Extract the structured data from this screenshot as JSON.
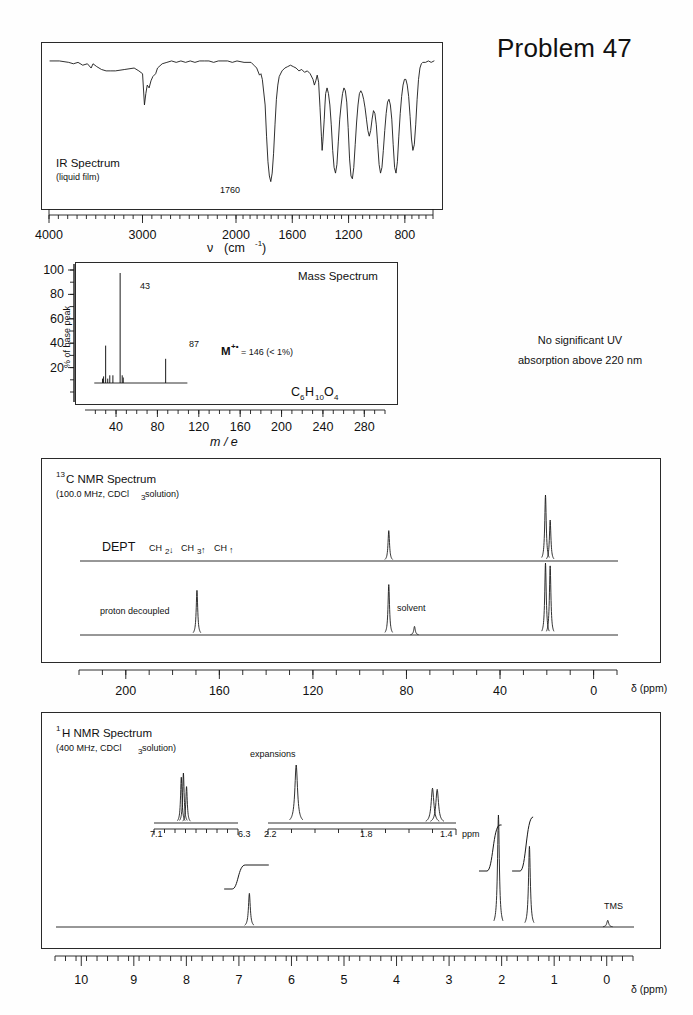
{
  "header": {
    "title": "Problem 47"
  },
  "uv": {
    "line1": "No significant UV",
    "line2": "absorption above 220 nm"
  },
  "ir": {
    "title": "IR Spectrum",
    "subtitle": "(liquid film)",
    "peak_label": "1760",
    "axis_label_symbol": "ν",
    "axis_label_unit": "(cm",
    "axis_label_exp": "-1",
    "axis_label_close": ")",
    "ticks": [
      "4000",
      "3000",
      "2000",
      "1600",
      "1200",
      "800"
    ],
    "tick_values": [
      4000,
      3000,
      2000,
      1600,
      1200,
      800
    ]
  },
  "ms": {
    "title": "Mass Spectrum",
    "ylabel": "% of base peak",
    "xlabel": "m / e",
    "formula_parts": [
      "C",
      "6",
      "H",
      "10",
      "O",
      "4"
    ],
    "molecular_ion": "M",
    "molecular_ion_sup": "+•",
    "molecular_ion_rest": " = 146  (< 1%)",
    "yticks": [
      "100",
      "80",
      "60",
      "40",
      "20"
    ],
    "ytick_values": [
      100,
      80,
      60,
      40,
      20
    ],
    "xticks": [
      "40",
      "80",
      "120",
      "160",
      "200",
      "240",
      "280"
    ],
    "xtick_values": [
      40,
      80,
      120,
      160,
      200,
      240,
      280
    ],
    "peak_labels": [
      "43",
      "87"
    ]
  },
  "c13": {
    "title_sup": "13",
    "title": "C NMR Spectrum",
    "subtitle_a": "(100.0 MHz, CDCl",
    "subtitle_sub": "3",
    "subtitle_b": " solution)",
    "dept_label": "DEPT",
    "dept_keys": [
      "CH",
      "CH",
      "CH"
    ],
    "dept_subs": [
      "2",
      "3",
      ""
    ],
    "dept_arrows": [
      "↓",
      "↑",
      "↑"
    ],
    "decoupled_label": "proton decoupled",
    "solvent_label": "solvent",
    "axis_label": "δ (ppm)",
    "ticks": [
      "200",
      "160",
      "120",
      "80",
      "40",
      "0"
    ],
    "tick_values": [
      200,
      160,
      120,
      80,
      40,
      0
    ]
  },
  "h1": {
    "title_sup": "1",
    "title": "H NMR Spectrum",
    "subtitle_a": "(400 MHz, CDCl",
    "subtitle_sub": "3",
    "subtitle_b": " solution)",
    "expansions_label": "expansions",
    "tms_label": "TMS",
    "axis_label": "δ (ppm)",
    "ticks": [
      "10",
      "9",
      "8",
      "7",
      "6",
      "5",
      "4",
      "3",
      "2",
      "1",
      "0"
    ],
    "tick_values": [
      10,
      9,
      8,
      7,
      6,
      5,
      4,
      3,
      2,
      1,
      0
    ],
    "expansion_left": {
      "start": "7.1",
      "end": "6.3"
    },
    "expansion_right": {
      "start": "2.2",
      "mid": "1.8",
      "end": "1.4",
      "unit": "ppm"
    }
  },
  "chart_data": [
    {
      "type": "line",
      "name": "ir-spectrum",
      "title": "IR Spectrum",
      "xlabel": "wavenumber (cm-1)",
      "ylabel": "transmittance",
      "xlim": [
        4000,
        600
      ],
      "ylim": [
        0,
        100
      ],
      "annotations": [
        {
          "x": 1760,
          "text": "1760"
        }
      ],
      "points": [
        [
          4000,
          93
        ],
        [
          3900,
          93
        ],
        [
          3800,
          92
        ],
        [
          3750,
          91
        ],
        [
          3700,
          92
        ],
        [
          3650,
          90
        ],
        [
          3600,
          91
        ],
        [
          3560,
          88
        ],
        [
          3540,
          91
        ],
        [
          3500,
          89
        ],
        [
          3450,
          87
        ],
        [
          3400,
          86
        ],
        [
          3350,
          86
        ],
        [
          3300,
          86
        ],
        [
          3200,
          87
        ],
        [
          3100,
          88
        ],
        [
          3050,
          86
        ],
        [
          3010,
          84
        ],
        [
          2990,
          62
        ],
        [
          2975,
          70
        ],
        [
          2960,
          76
        ],
        [
          2940,
          74
        ],
        [
          2920,
          79
        ],
        [
          2900,
          82
        ],
        [
          2870,
          84
        ],
        [
          2850,
          88
        ],
        [
          2800,
          91
        ],
        [
          2750,
          92
        ],
        [
          2700,
          93
        ],
        [
          2650,
          92
        ],
        [
          2600,
          93
        ],
        [
          2550,
          92
        ],
        [
          2500,
          93
        ],
        [
          2450,
          92
        ],
        [
          2400,
          93
        ],
        [
          2350,
          93
        ],
        [
          2300,
          93
        ],
        [
          2250,
          92
        ],
        [
          2200,
          93
        ],
        [
          2150,
          93
        ],
        [
          2100,
          93
        ],
        [
          2050,
          92
        ],
        [
          2000,
          93
        ],
        [
          1950,
          92
        ],
        [
          1900,
          92
        ],
        [
          1880,
          90
        ],
        [
          1860,
          88
        ],
        [
          1840,
          83
        ],
        [
          1830,
          84
        ],
        [
          1820,
          80
        ],
        [
          1800,
          62
        ],
        [
          1790,
          40
        ],
        [
          1780,
          22
        ],
        [
          1770,
          12
        ],
        [
          1760,
          8
        ],
        [
          1750,
          14
        ],
        [
          1740,
          28
        ],
        [
          1730,
          48
        ],
        [
          1720,
          66
        ],
        [
          1710,
          76
        ],
        [
          1700,
          82
        ],
        [
          1680,
          86
        ],
        [
          1660,
          88
        ],
        [
          1640,
          89
        ],
        [
          1620,
          90
        ],
        [
          1600,
          89
        ],
        [
          1580,
          88
        ],
        [
          1560,
          86
        ],
        [
          1540,
          87
        ],
        [
          1520,
          85
        ],
        [
          1500,
          86
        ],
        [
          1480,
          84
        ],
        [
          1460,
          80
        ],
        [
          1450,
          76
        ],
        [
          1440,
          79
        ],
        [
          1430,
          83
        ],
        [
          1420,
          78
        ],
        [
          1410,
          60
        ],
        [
          1400,
          40
        ],
        [
          1395,
          30
        ],
        [
          1390,
          36
        ],
        [
          1380,
          52
        ],
        [
          1375,
          62
        ],
        [
          1370,
          70
        ],
        [
          1360,
          74
        ],
        [
          1350,
          70
        ],
        [
          1340,
          62
        ],
        [
          1330,
          48
        ],
        [
          1320,
          30
        ],
        [
          1310,
          18
        ],
        [
          1300,
          14
        ],
        [
          1290,
          20
        ],
        [
          1280,
          36
        ],
        [
          1270,
          52
        ],
        [
          1260,
          62
        ],
        [
          1250,
          70
        ],
        [
          1240,
          74
        ],
        [
          1230,
          72
        ],
        [
          1220,
          64
        ],
        [
          1210,
          46
        ],
        [
          1200,
          24
        ],
        [
          1190,
          12
        ],
        [
          1180,
          10
        ],
        [
          1170,
          18
        ],
        [
          1160,
          34
        ],
        [
          1150,
          50
        ],
        [
          1140,
          62
        ],
        [
          1130,
          70
        ],
        [
          1120,
          72
        ],
        [
          1110,
          70
        ],
        [
          1100,
          66
        ],
        [
          1090,
          60
        ],
        [
          1080,
          52
        ],
        [
          1070,
          44
        ],
        [
          1060,
          40
        ],
        [
          1050,
          44
        ],
        [
          1040,
          52
        ],
        [
          1030,
          58
        ],
        [
          1020,
          56
        ],
        [
          1010,
          48
        ],
        [
          1000,
          34
        ],
        [
          990,
          20
        ],
        [
          980,
          14
        ],
        [
          970,
          18
        ],
        [
          960,
          30
        ],
        [
          950,
          44
        ],
        [
          940,
          56
        ],
        [
          930,
          64
        ],
        [
          920,
          66
        ],
        [
          910,
          62
        ],
        [
          900,
          52
        ],
        [
          890,
          34
        ],
        [
          880,
          18
        ],
        [
          870,
          14
        ],
        [
          860,
          22
        ],
        [
          850,
          40
        ],
        [
          840,
          56
        ],
        [
          830,
          68
        ],
        [
          820,
          76
        ],
        [
          810,
          80
        ],
        [
          800,
          80
        ],
        [
          790,
          76
        ],
        [
          780,
          68
        ],
        [
          770,
          54
        ],
        [
          760,
          38
        ],
        [
          750,
          30
        ],
        [
          740,
          34
        ],
        [
          730,
          48
        ],
        [
          720,
          66
        ],
        [
          710,
          80
        ],
        [
          700,
          88
        ],
        [
          690,
          91
        ],
        [
          680,
          92
        ],
        [
          660,
          92
        ],
        [
          640,
          93
        ],
        [
          620,
          92
        ],
        [
          600,
          93
        ]
      ]
    },
    {
      "type": "bar",
      "name": "mass-spectrum",
      "title": "Mass Spectrum",
      "xlabel": "m / e",
      "ylabel": "% of base peak",
      "xlim": [
        10,
        300
      ],
      "ylim": [
        0,
        100
      ],
      "annotations": [
        {
          "x": 43,
          "text": "43"
        },
        {
          "x": 87,
          "text": "87"
        },
        {
          "text": "M+• = 146  (< 1%)"
        }
      ],
      "peaks": [
        {
          "mz": 26,
          "intensity": 4
        },
        {
          "mz": 27,
          "intensity": 6
        },
        {
          "mz": 29,
          "intensity": 34
        },
        {
          "mz": 31,
          "intensity": 4
        },
        {
          "mz": 33,
          "intensity": 7
        },
        {
          "mz": 36,
          "intensity": 7
        },
        {
          "mz": 43,
          "intensity": 100
        },
        {
          "mz": 45,
          "intensity": 7
        },
        {
          "mz": 46,
          "intensity": 5
        },
        {
          "mz": 87,
          "intensity": 22
        }
      ]
    },
    {
      "type": "line",
      "name": "c13-dept",
      "title": "DEPT",
      "xlabel": "δ (ppm)",
      "xlim": [
        220,
        -10
      ],
      "peaks": [
        {
          "ppm": 88,
          "intensity": 46,
          "phase": "up"
        },
        {
          "ppm": 21,
          "intensity": 100,
          "phase": "up"
        },
        {
          "ppm": 19,
          "intensity": 62,
          "phase": "up"
        }
      ]
    },
    {
      "type": "line",
      "name": "c13-decoupled",
      "title": "proton decoupled",
      "xlabel": "δ (ppm)",
      "xlim": [
        220,
        -10
      ],
      "peaks": [
        {
          "ppm": 170,
          "intensity": 62
        },
        {
          "ppm": 88,
          "intensity": 70
        },
        {
          "ppm": 77,
          "intensity": 12,
          "label": "solvent"
        },
        {
          "ppm": 21,
          "intensity": 100
        },
        {
          "ppm": 19,
          "intensity": 96
        }
      ]
    },
    {
      "type": "line",
      "name": "h1-nmr",
      "title": "1H NMR Spectrum",
      "xlabel": "δ (ppm)",
      "xlim": [
        10.5,
        -0.5
      ],
      "peaks": [
        {
          "ppm": 6.82,
          "intensity": 30,
          "integral": 1
        },
        {
          "ppm": 2.08,
          "intensity": 100,
          "integral": 3
        },
        {
          "ppm": 1.49,
          "intensity": 72,
          "integral": 3
        },
        {
          "ppm": 0.0,
          "intensity": 6,
          "label": "TMS"
        }
      ]
    },
    {
      "type": "line",
      "name": "h1-expansion-left",
      "xlim": [
        7.1,
        6.3
      ],
      "peaks": [
        {
          "ppm": 6.84,
          "intensity": 88
        },
        {
          "ppm": 6.82,
          "intensity": 96
        },
        {
          "ppm": 6.79,
          "intensity": 70
        }
      ]
    },
    {
      "type": "line",
      "name": "h1-expansion-right",
      "xlim": [
        2.2,
        1.4
      ],
      "peaks": [
        {
          "ppm": 2.08,
          "intensity": 100
        },
        {
          "ppm": 1.5,
          "intensity": 60
        },
        {
          "ppm": 1.48,
          "intensity": 58
        }
      ]
    }
  ]
}
